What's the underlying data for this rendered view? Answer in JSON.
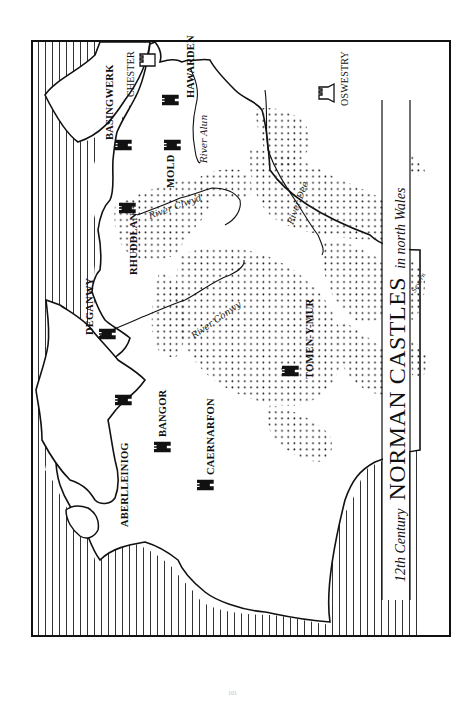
{
  "map": {
    "title": {
      "prefix": "12th Century",
      "main": "NORMAN CASTLES",
      "suffix": "in north Wales"
    },
    "castles_norman": [
      {
        "name": "BASINGWERK"
      },
      {
        "name": "HAWARDEN"
      },
      {
        "name": "MOLD"
      },
      {
        "name": "RHUDDLAN"
      },
      {
        "name": "DEGANWY"
      },
      {
        "name": "BANGOR"
      },
      {
        "name": "ABERLLEINIOG"
      },
      {
        "name": "CAERNARFON"
      },
      {
        "name": "TOMEN-Y-MUR"
      }
    ],
    "castles_english": [
      {
        "name": "CHESTER"
      },
      {
        "name": "OSWESTRY"
      }
    ],
    "rivers": [
      {
        "name": "River Alun"
      },
      {
        "name": "River Clwyd"
      },
      {
        "name": "River Dee"
      },
      {
        "name": "River Conwy"
      },
      {
        "name": "Severn"
      }
    ],
    "legend_hint": {
      "hatching": "sea",
      "dots": "upland",
      "filled_tower": "norman castle",
      "outline_tower": "english border castle"
    }
  },
  "page": {
    "number": "101"
  }
}
